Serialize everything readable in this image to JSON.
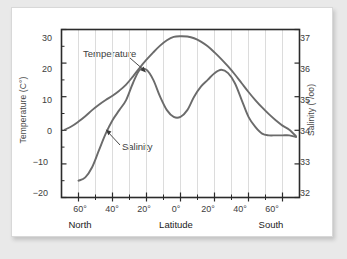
{
  "chart_data": {
    "type": "line",
    "title": "",
    "xlabel": "Latitude",
    "ylabel": "Temperature (C°)",
    "y2label": "Salinity (°/oo)",
    "xlim": [
      70,
      -70
    ],
    "ylim": [
      -20,
      30
    ],
    "y2lim": [
      32,
      37
    ],
    "grid": true,
    "legend_position": "inline-annotations",
    "x_tick_labels": [
      "60°",
      "40°",
      "20°",
      "0°",
      "20°",
      "40°",
      "60°"
    ],
    "x_tick_values": [
      60,
      40,
      20,
      0,
      -20,
      -40,
      -60
    ],
    "y_left_tick_labels": [
      "30",
      "20",
      "10",
      "0",
      "−10",
      "−20"
    ],
    "y_left_tick_values": [
      30,
      20,
      10,
      0,
      -10,
      -20
    ],
    "y_right_tick_labels": [
      "37",
      "36",
      "35",
      "34",
      "33",
      "32"
    ],
    "y_right_tick_values": [
      37,
      36,
      35,
      34,
      33,
      32
    ],
    "region_left": "North",
    "region_right": "South",
    "series": [
      {
        "name": "Temperature",
        "axis": "left",
        "units": "C°",
        "color": "#6b6b6b",
        "x": [
          68,
          64,
          60,
          56,
          52,
          48,
          44,
          40,
          36,
          32,
          28,
          24,
          20,
          16,
          12,
          8,
          4,
          0,
          -4,
          -8,
          -12,
          -16,
          -20,
          -24,
          -28,
          -32,
          -36,
          -40,
          -44,
          -48,
          -52,
          -56,
          -60,
          -64,
          -68
        ],
        "values": [
          0.2,
          1.2,
          2.6,
          4.2,
          6.0,
          7.6,
          9.0,
          10.3,
          11.8,
          13.6,
          16.0,
          18.6,
          21.0,
          23.2,
          25.2,
          26.8,
          27.8,
          28.0,
          27.9,
          27.4,
          26.4,
          25.0,
          23.2,
          21.2,
          19.0,
          16.6,
          14.0,
          11.4,
          9.0,
          6.8,
          4.8,
          3.0,
          1.4,
          0.2,
          -1.8
        ]
      },
      {
        "name": "Salinity",
        "axis": "right",
        "units": "°/oo",
        "color": "#6b6b6b",
        "x": [
          60,
          56,
          52,
          48,
          44,
          40,
          36,
          32,
          28,
          24,
          20,
          16,
          12,
          8,
          4,
          0,
          -4,
          -8,
          -12,
          -16,
          -20,
          -24,
          -28,
          -32,
          -36,
          -40,
          -44,
          -48,
          -52,
          -56,
          -60,
          -64,
          -68
        ],
        "values": [
          32.5,
          32.6,
          32.9,
          33.4,
          33.9,
          34.3,
          34.6,
          34.9,
          35.4,
          35.8,
          35.8,
          35.5,
          35.0,
          34.6,
          34.4,
          34.4,
          34.6,
          35.0,
          35.3,
          35.5,
          35.7,
          35.8,
          35.7,
          35.4,
          34.9,
          34.4,
          34.1,
          33.9,
          33.85,
          33.85,
          33.85,
          33.85,
          33.8
        ]
      }
    ],
    "annotations": [
      {
        "text": "Temperature",
        "points_to": "temperature-curve"
      },
      {
        "text": "Salinity",
        "points_to": "salinity-curve"
      }
    ]
  },
  "axes": {
    "left_title": "Temperature (C°)",
    "right_title": "Salinity (°/oo)",
    "x_title": "Latitude",
    "left_ticks": [
      "30",
      "20",
      "10",
      "0",
      "−10",
      "−20"
    ],
    "right_ticks": [
      "37",
      "36",
      "35",
      "34",
      "33",
      "32"
    ],
    "x_ticks": [
      "60°",
      "40°",
      "20°",
      "0°",
      "20°",
      "40°",
      "60°"
    ],
    "region_left": "North",
    "region_right": "South"
  },
  "labels": {
    "temperature": "Temperature",
    "salinity": "Salinity"
  },
  "colors": {
    "curve": "#6b6b6b",
    "axis": "#2b2b2b",
    "grid": "#dcdcdc",
    "card": "#ffffff",
    "page": "#e9e9e9"
  }
}
